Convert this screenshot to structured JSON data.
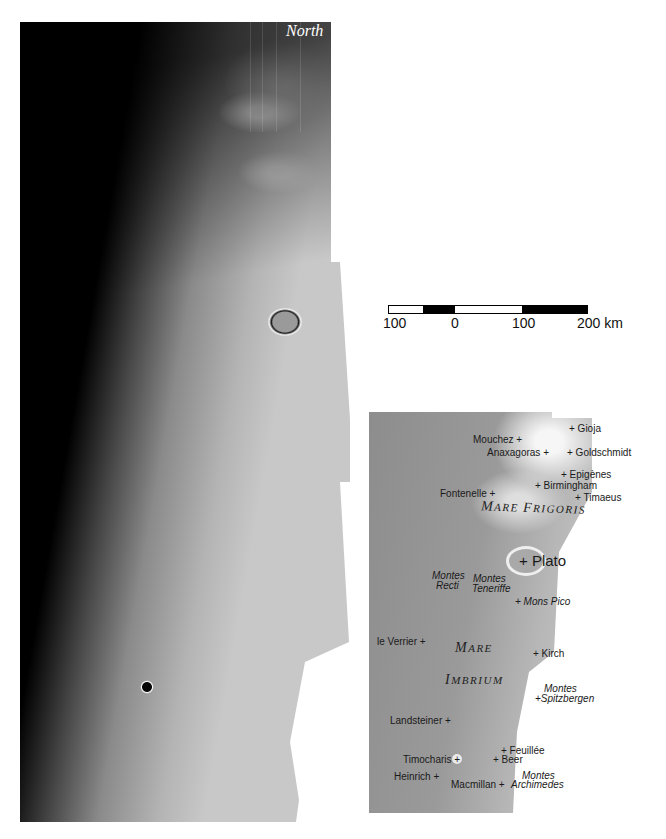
{
  "photo": {
    "orientation_label": "North",
    "description": "Mosaic photograph of the lunar terminator region around Mare Imbrium and Mare Frigoris"
  },
  "scale_bar": {
    "ticks": [
      "100",
      "0",
      "100",
      "200 km"
    ],
    "segments": [
      {
        "color": "#ffffff",
        "width": 50
      },
      {
        "color": "#000000",
        "width": 50
      },
      {
        "color": "#ffffff",
        "width": 100
      },
      {
        "color": "#000000",
        "width": 100
      }
    ]
  },
  "key_map": {
    "features": [
      {
        "name": "Gioja",
        "style": "normal",
        "marker": "before"
      },
      {
        "name": "Mouchez",
        "style": "normal",
        "marker": "after"
      },
      {
        "name": "Anaxagoras",
        "style": "normal",
        "marker": "after"
      },
      {
        "name": "Goldschmidt",
        "style": "normal",
        "marker": "before"
      },
      {
        "name": "Epigènes",
        "style": "normal",
        "marker": "before"
      },
      {
        "name": "Birmingham",
        "style": "normal",
        "marker": "before"
      },
      {
        "name": "Fontenelle",
        "style": "normal",
        "marker": "after"
      },
      {
        "name": "Timaeus",
        "style": "normal",
        "marker": "before"
      },
      {
        "name": "Plato",
        "style": "large",
        "marker": "before"
      },
      {
        "name": "Montes Recti",
        "style": "italic",
        "marker": "none"
      },
      {
        "name": "Montes Teneriffe",
        "style": "italic",
        "marker": "none"
      },
      {
        "name": "Mons Pico",
        "style": "italic",
        "marker": "before"
      },
      {
        "name": "le Verrier",
        "style": "normal",
        "marker": "after"
      },
      {
        "name": "Kirch",
        "style": "normal",
        "marker": "before"
      },
      {
        "name": "Montes Spitzbergen",
        "style": "italic",
        "marker": "before"
      },
      {
        "name": "Landsteiner",
        "style": "normal",
        "marker": "after"
      },
      {
        "name": "Timocharis",
        "style": "normal",
        "marker": "after"
      },
      {
        "name": "Feuillée",
        "style": "normal",
        "marker": "before"
      },
      {
        "name": "Beer",
        "style": "normal",
        "marker": "before"
      },
      {
        "name": "Heinrich",
        "style": "normal",
        "marker": "after"
      },
      {
        "name": "Macmillan",
        "style": "normal",
        "marker": "after"
      },
      {
        "name": "Montes Archimedes",
        "style": "italic",
        "marker": "none"
      }
    ],
    "maria": [
      {
        "name": "Mare Frigoris",
        "line1": "Mare Frigoris"
      },
      {
        "name": "Mare Imbrium",
        "line1": "Mare",
        "line2": "Imbrium"
      }
    ],
    "text": {
      "gioja": "+ Gioja",
      "mouchez": "Mouchez +",
      "anaxagoras": "Anaxagoras +",
      "goldschmidt": "+ Goldschmidt",
      "epigenes": "+ Epigènes",
      "birmingham": "+ Birmingham",
      "fontenelle": "Fontenelle +",
      "timaeus": "+ Timaeus",
      "plato": "+ Plato",
      "montes_recti_1": "Montes",
      "montes_recti_2": "Recti",
      "montes_teneriffe_1": "Montes",
      "montes_teneriffe_2": "Teneriffe",
      "mons_pico": "+ Mons Pico",
      "le_verrier": "le Verrier +",
      "kirch": "+ Kirch",
      "spitzbergen_1": "Montes",
      "spitzbergen_2": "+Spitzbergen",
      "landsteiner": "Landsteiner +",
      "timocharis": "Timocharis +",
      "feuillee": "+ Feuillée",
      "beer": "+ Beer",
      "heinrich": "Heinrich +",
      "macmillan": "Macmillan +",
      "archimedes_1": "Montes",
      "archimedes_2": "Archimedes",
      "mare_frigoris_a": "M",
      "mare_frigoris_b": "ARE ",
      "mare_frigoris_c": "F",
      "mare_frigoris_d": "RIGORIS",
      "mare_imbrium_1a": "M",
      "mare_imbrium_1b": "ARE",
      "mare_imbrium_2a": "I",
      "mare_imbrium_2b": "MBRIUM"
    }
  }
}
